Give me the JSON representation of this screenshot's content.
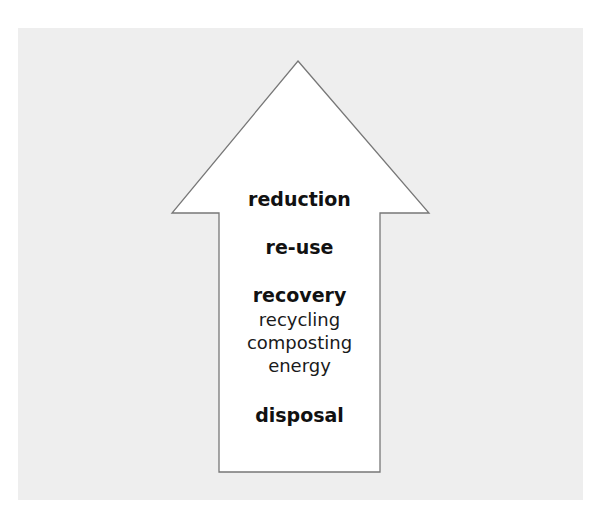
{
  "diagram": {
    "type": "waste-hierarchy-arrow",
    "direction": "up",
    "colors": {
      "background_panel": "#eeeeee",
      "arrow_fill": "#ffffff",
      "arrow_stroke": "#777777",
      "text": "#111111"
    },
    "levels": [
      {
        "label": "reduction"
      },
      {
        "label": "re-use"
      },
      {
        "label": "recovery",
        "sub_items": [
          "recycling",
          "composting",
          "energy"
        ]
      },
      {
        "label": "disposal"
      }
    ]
  }
}
